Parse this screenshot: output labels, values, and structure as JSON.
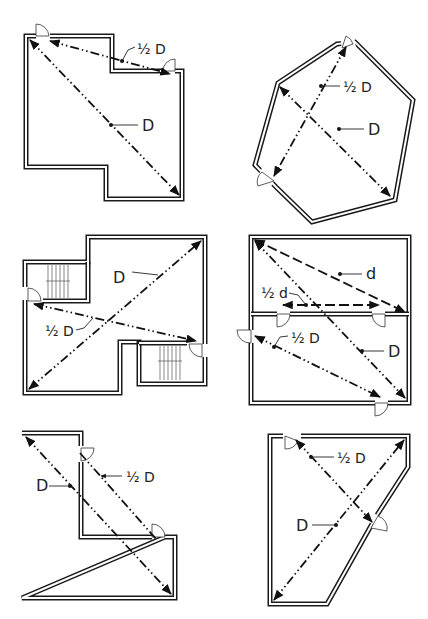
{
  "diagram": {
    "title": "",
    "panels": [
      {
        "id": "panel-1",
        "description": "Irregular room with a notch at the top right and an offset at the bottom; two exits",
        "labels": {
          "diagonal": "D",
          "exit_separation": "½ D"
        }
      },
      {
        "id": "panel-2",
        "description": "Hexagonal room with two exits",
        "labels": {
          "diagonal": "D",
          "exit_separation": "½ D"
        }
      },
      {
        "id": "panel-3",
        "description": "Floor with two stairwells and a central column notch",
        "labels": {
          "diagonal": "D",
          "exit_separation": "½ D"
        }
      },
      {
        "id": "panel-4",
        "description": "Two rooms stacked vertically: upper room with diagonal d, lower room with exits",
        "labels": {
          "upper_diagonal": "d",
          "upper_exit_separation": "½ d",
          "overall_diagonal": "D",
          "lower_exit_separation": "½ D"
        }
      },
      {
        "id": "panel-5",
        "description": "L-shaped room with two exits along the inner corner",
        "labels": {
          "diagonal": "D",
          "exit_separation": "½ D"
        }
      },
      {
        "id": "panel-6",
        "description": "Trapezoidal room with an angled right wall and two exits",
        "labels": {
          "diagonal": "D",
          "exit_separation": "½ D"
        }
      }
    ]
  },
  "colors": {
    "line": "#111111",
    "background": "#ffffff"
  }
}
